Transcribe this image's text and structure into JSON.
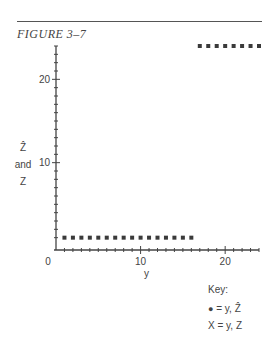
{
  "figure": {
    "title": "FIGURE 3–7"
  },
  "chart_data": {
    "type": "scatter",
    "title": "FIGURE 3–7",
    "xlabel": "y",
    "ylabel_lines": [
      "Ẑ",
      "and",
      "Z"
    ],
    "xlim": [
      0,
      24
    ],
    "ylim": [
      0,
      24
    ],
    "x_ticks": [
      0,
      10,
      20
    ],
    "y_ticks": [
      10,
      20
    ],
    "x_tick_labels": [
      "0",
      "10",
      "20"
    ],
    "y_tick_labels": [
      "10",
      "20"
    ],
    "minor_tick_step": 1,
    "grid": false,
    "legend_position": "bottom-right",
    "series": [
      {
        "name": "y, Z",
        "marker": "x",
        "points": [
          [
            1,
            1
          ],
          [
            2,
            1
          ],
          [
            3,
            1
          ],
          [
            4,
            1
          ],
          [
            5,
            1
          ],
          [
            6,
            1
          ],
          [
            7,
            1
          ],
          [
            8,
            1
          ],
          [
            9,
            1
          ],
          [
            10,
            1
          ],
          [
            11,
            1
          ],
          [
            12,
            1
          ],
          [
            13,
            1
          ],
          [
            14,
            1
          ],
          [
            15,
            1
          ],
          [
            16,
            1
          ],
          [
            17,
            24
          ],
          [
            18,
            24
          ],
          [
            19,
            24
          ],
          [
            20,
            24
          ],
          [
            21,
            24
          ],
          [
            22,
            24
          ],
          [
            23,
            24
          ],
          [
            24,
            24
          ]
        ]
      },
      {
        "name": "y, Ẑ",
        "marker": "dot",
        "points": []
      }
    ],
    "key": {
      "title": "Key:",
      "entries": [
        {
          "symbol": "●",
          "label": "= y, Ẑ"
        },
        {
          "symbol": "X",
          "label": "= y, Z"
        }
      ]
    }
  }
}
